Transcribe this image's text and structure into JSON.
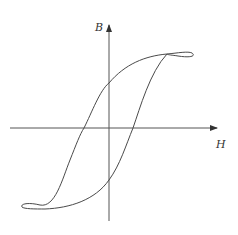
{
  "diagram": {
    "axes": {
      "x_label": "H",
      "y_label": "B"
    },
    "colors": {
      "line": "#4a4a4a",
      "axis": "#555555",
      "background": "#ffffff"
    }
  }
}
